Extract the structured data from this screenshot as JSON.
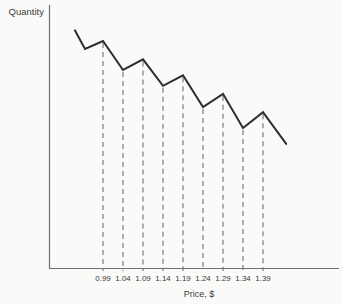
{
  "figure": {
    "ylabel": "Quantity",
    "xlabel": "Price, $"
  },
  "colors": {
    "background": "#fafaf8",
    "curve": "#2e2e2e",
    "axis": "#6f6f6f",
    "dropline": "#6f6f6f",
    "text": "#3a3a3a"
  },
  "chart_data": {
    "type": "line",
    "title": "",
    "xlabel": "Price, $",
    "ylabel": "Quantity",
    "x_tick_labels": [
      "0.99",
      "1.04",
      "1.09",
      "1.14",
      "1.19",
      "1.24",
      "1.29",
      "1.34",
      "1.39"
    ],
    "y_tick_labels": [],
    "grid": false,
    "legend": false,
    "style": "sawtooth (zigzag) demand curve; dashed vertical droplines from each labeled vertex down to the price axis",
    "x_range_approx": [
      0.92,
      1.45
    ],
    "quantity_scale": "relative 0-100 (y axis unlabeled)",
    "series": [
      {
        "name": "Quantity demanded",
        "points": [
          {
            "price": 0.92,
            "quantity_rel": 90,
            "dropline": false,
            "label": ""
          },
          {
            "price": 0.945,
            "quantity_rel": 83,
            "dropline": false,
            "label": ""
          },
          {
            "price": 0.99,
            "quantity_rel": 86,
            "dropline": true,
            "label": "0.99"
          },
          {
            "price": 1.04,
            "quantity_rel": 75,
            "dropline": true,
            "label": "1.04"
          },
          {
            "price": 1.09,
            "quantity_rel": 79,
            "dropline": true,
            "label": "1.09"
          },
          {
            "price": 1.14,
            "quantity_rel": 69,
            "dropline": true,
            "label": "1.14"
          },
          {
            "price": 1.19,
            "quantity_rel": 73,
            "dropline": true,
            "label": "1.19"
          },
          {
            "price": 1.24,
            "quantity_rel": 61,
            "dropline": true,
            "label": "1.24"
          },
          {
            "price": 1.29,
            "quantity_rel": 66,
            "dropline": true,
            "label": "1.29"
          },
          {
            "price": 1.34,
            "quantity_rel": 53,
            "dropline": true,
            "label": "1.34"
          },
          {
            "price": 1.39,
            "quantity_rel": 59,
            "dropline": true,
            "label": "1.39"
          },
          {
            "price": 1.448,
            "quantity_rel": 47,
            "dropline": false,
            "label": ""
          }
        ]
      }
    ]
  }
}
